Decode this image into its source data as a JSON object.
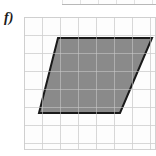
{
  "figure": {
    "label": "f)",
    "shape_name": "parallelogram",
    "caption": ""
  },
  "colors": {
    "shape_fill": "#8a8a8a",
    "shape_stroke": "#1a1a1a",
    "grid_line": "#e4e4e4",
    "grid_border": "#d2d2d2",
    "panel_background": "#fdfdfd",
    "label_text": "#1a1a1a",
    "page_background": "#ffffff"
  },
  "chart_data": {
    "type": "scatter",
    "subtitle": "",
    "xlabel": "",
    "ylabel": "",
    "grid": true,
    "legend": null,
    "grid_columns": 7,
    "grid_rows": 7,
    "cell_size_px": 18,
    "xlim": [
      0,
      7
    ],
    "ylim": [
      0,
      7
    ],
    "x": [
      1.9,
      7.1,
      5.35,
      0.85
    ],
    "y": [
      5.85,
      5.85,
      1.7,
      1.7
    ],
    "annotations": [
      {
        "text": "f)",
        "x": -1.2,
        "y": 6.6
      }
    ],
    "shapes": [
      {
        "kind": "polygon",
        "name": "parallelogram",
        "fill": "#8a8a8a",
        "stroke": "#1a1a1a",
        "stroke_width_px": 2,
        "vertices_px": [
          [
            58,
            38
          ],
          [
            152,
            38
          ],
          [
            120,
            113
          ],
          [
            39,
            113
          ]
        ],
        "vertices_grid": [
          [
            1.9,
            5.85
          ],
          [
            7.1,
            5.85
          ],
          [
            5.35,
            1.7
          ],
          [
            0.85,
            1.7
          ]
        ],
        "base_cells": 5,
        "height_cells": 4,
        "area_cells": 20
      }
    ]
  },
  "top_fragment": {
    "present": true,
    "description": "bottom edge of the grid from the figure above, cropped"
  }
}
